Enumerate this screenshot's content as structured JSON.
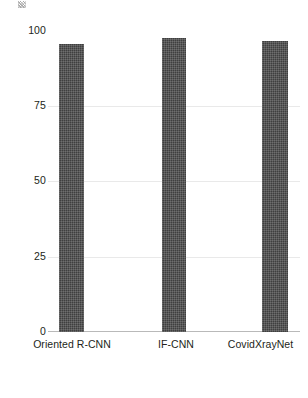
{
  "chart_data": {
    "type": "bar",
    "title": "",
    "subtitle": "",
    "xlabel": "",
    "ylabel": "",
    "categories": [
      "Oriented R-CNN",
      "IF-CNN",
      "CovidXrayNet"
    ],
    "values": [
      96,
      98,
      97
    ],
    "series": [
      {
        "name": "Accuracy",
        "values": [
          96,
          98,
          97
        ]
      }
    ],
    "ylim": [
      0,
      100
    ],
    "yticks": [
      0,
      25,
      50,
      75,
      100
    ],
    "ytick_labels": [
      "0",
      "25",
      "50",
      "75",
      "100"
    ],
    "xticks": [
      "Oriented R-CNN",
      "IF-CNN",
      "CovidXrayNet"
    ],
    "grid": "horizontal",
    "gridlines_at": [
      25,
      50,
      75
    ],
    "legend": null,
    "legend_position": "none",
    "annotations": [],
    "bar_color": "#3f3f3f",
    "gridline_color": "#e9e9e9",
    "axis_color": "#b9b9b9",
    "background_color": "#ffffff",
    "text_color": "#231f20"
  },
  "axis": {
    "y_ticks": [
      {
        "label": "100",
        "value": 100
      },
      {
        "label": "75",
        "value": 75
      },
      {
        "label": "50",
        "value": 50
      },
      {
        "label": "25",
        "value": 25
      },
      {
        "label": "0",
        "value": 0
      }
    ],
    "x_ticks": [
      {
        "label": "Oriented R-CNN"
      },
      {
        "label": "IF-CNN"
      },
      {
        "label": "CovidXrayNet"
      }
    ]
  }
}
